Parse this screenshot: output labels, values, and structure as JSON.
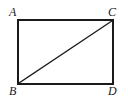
{
  "figure": {
    "kind": "rectangle-with-diagonal",
    "background_color": "#ffffff",
    "stroke_color": "#1a1a1a",
    "rectangle_stroke_width": 2,
    "diagonal_stroke_width": 1.3,
    "bounds": {
      "left": 18,
      "top": 20,
      "right": 113,
      "bottom": 84
    },
    "vertices": [
      {
        "name": "A",
        "label": "A",
        "position": "top-left",
        "x": 18,
        "y": 20
      },
      {
        "name": "C",
        "label": "C",
        "position": "top-right",
        "x": 113,
        "y": 20
      },
      {
        "name": "B",
        "label": "B",
        "position": "bottom-left",
        "x": 18,
        "y": 84
      },
      {
        "name": "D",
        "label": "D",
        "position": "bottom-right",
        "x": 113,
        "y": 84
      }
    ],
    "edges": [
      {
        "name": "top-edge",
        "from": "A",
        "to": "C"
      },
      {
        "name": "right-edge",
        "from": "C",
        "to": "D"
      },
      {
        "name": "bottom-edge",
        "from": "D",
        "to": "B"
      },
      {
        "name": "left-edge",
        "from": "B",
        "to": "A"
      }
    ],
    "diagonal": {
      "name": "diagonal-BC",
      "from": "B",
      "to": "C"
    }
  }
}
